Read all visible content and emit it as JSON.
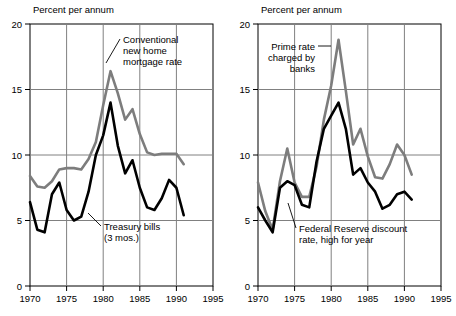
{
  "chart_data": [
    {
      "type": "line",
      "title": "Percent per annum",
      "xlabel": "",
      "ylabel": "Percent per annum",
      "xlim": [
        1970,
        1995
      ],
      "ylim": [
        0,
        20
      ],
      "yticks": [
        0,
        5,
        10,
        15,
        20
      ],
      "xticks": [
        1970,
        1975,
        1980,
        1985,
        1990,
        1995
      ],
      "grid": true,
      "legend": "annotations-inline",
      "x": [
        1970,
        1971,
        1972,
        1973,
        1974,
        1975,
        1976,
        1977,
        1978,
        1979,
        1980,
        1981,
        1982,
        1983,
        1984,
        1985,
        1986,
        1987,
        1988,
        1989,
        1990,
        1991
      ],
      "series": [
        {
          "name": "Conventional new home mortgage rate",
          "color": "#7d7d7d",
          "values": [
            8.4,
            7.6,
            7.5,
            8.0,
            8.9,
            9.0,
            9.0,
            8.9,
            9.7,
            11.0,
            13.8,
            16.4,
            14.7,
            12.7,
            13.5,
            11.6,
            10.2,
            10.0,
            10.1,
            10.1,
            10.1,
            9.3
          ]
        },
        {
          "name": "Treasury bills (3 mos.)",
          "color": "#000000",
          "values": [
            6.4,
            4.3,
            4.1,
            7.0,
            7.9,
            5.8,
            5.0,
            5.3,
            7.2,
            10.0,
            11.5,
            14.0,
            10.7,
            8.6,
            9.6,
            7.5,
            6.0,
            5.8,
            6.7,
            8.1,
            7.5,
            5.4
          ]
        }
      ],
      "annotations": [
        {
          "text_lines": [
            "Conventional",
            "new home",
            "mortgage rate"
          ],
          "align": "left"
        },
        {
          "text_lines": [
            "Treasury bills",
            "(3 mos.)"
          ],
          "align": "left"
        }
      ]
    },
    {
      "type": "line",
      "title": "Percent per annum",
      "xlabel": "",
      "ylabel": "Percent per annum",
      "xlim": [
        1970,
        1995
      ],
      "ylim": [
        0,
        20
      ],
      "yticks": [
        0,
        5,
        10,
        15,
        20
      ],
      "xticks": [
        1970,
        1975,
        1980,
        1985,
        1990,
        1995
      ],
      "grid": true,
      "legend": "annotations-inline",
      "x": [
        1970,
        1971,
        1972,
        1973,
        1974,
        1975,
        1976,
        1977,
        1978,
        1979,
        1980,
        1981,
        1982,
        1983,
        1984,
        1985,
        1986,
        1987,
        1988,
        1989,
        1990,
        1991
      ],
      "series": [
        {
          "name": "Prime rate charged by banks",
          "color": "#7d7d7d",
          "values": [
            7.9,
            5.7,
            4.3,
            8.0,
            10.5,
            7.9,
            6.8,
            6.8,
            9.1,
            12.7,
            15.3,
            18.8,
            14.9,
            10.8,
            12.0,
            9.9,
            8.3,
            8.2,
            9.3,
            10.8,
            10.0,
            8.5
          ]
        },
        {
          "name": "Federal Reserve discount rate, high for year",
          "color": "#000000",
          "values": [
            6.0,
            5.0,
            4.1,
            7.5,
            8.0,
            7.7,
            6.2,
            6.0,
            9.5,
            12.0,
            13.0,
            14.0,
            12.0,
            8.5,
            9.0,
            7.9,
            7.2,
            5.9,
            6.2,
            7.0,
            7.2,
            6.6
          ]
        }
      ],
      "annotations": [
        {
          "text_lines": [
            "Prime rate",
            "charged by",
            "banks"
          ],
          "align": "right"
        },
        {
          "text_lines": [
            "Federal Reserve discount",
            "rate, high for year"
          ],
          "align": "left"
        }
      ]
    }
  ],
  "panels": [
    {
      "id": "left",
      "axis_title": "Percent per annum",
      "y_tick_labels": [
        "20",
        "15",
        "10",
        "5",
        "0"
      ],
      "x_tick_labels": [
        "1970",
        "1975",
        "1980",
        "1985",
        "1990",
        "1995"
      ],
      "annotation_a": {
        "line1": "Conventional",
        "line2": "new home",
        "line3": "mortgage rate"
      },
      "annotation_b": {
        "line1": "Treasury bills",
        "line2": "(3 mos.)"
      }
    },
    {
      "id": "right",
      "axis_title": "Percent per annum",
      "y_tick_labels": [
        "20",
        "15",
        "10",
        "5",
        "0"
      ],
      "x_tick_labels": [
        "1970",
        "1975",
        "1980",
        "1985",
        "1990",
        "1995"
      ],
      "annotation_a": {
        "line1": "Prime rate",
        "line2": "charged by",
        "line3": "banks"
      },
      "annotation_b": {
        "line1": "Federal Reserve discount",
        "line2": "rate, high for year"
      }
    }
  ],
  "colors": {
    "upper_series": "#7d7d7d",
    "lower_series": "#000000",
    "grid": "#808080",
    "axis": "#000000",
    "background": "#ffffff"
  }
}
